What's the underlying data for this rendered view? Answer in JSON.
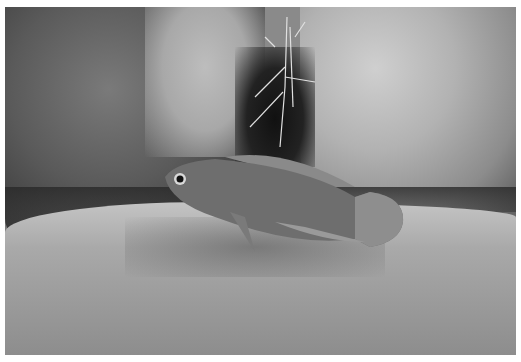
{
  "image": {
    "description": "Grayscale underwater photograph of a cichlid fish swimming above sand in front of rocks",
    "subject": "fish",
    "elements": [
      "left rock",
      "right rock",
      "dark crevice with roots",
      "sandy bottom",
      "fish"
    ],
    "colors": {
      "border": "#ffffff",
      "rock_dark": "#3a3a3a",
      "rock_light": "#c8c8c8",
      "sand": "#a9a9a9",
      "fish": "#6e6e6e"
    }
  }
}
